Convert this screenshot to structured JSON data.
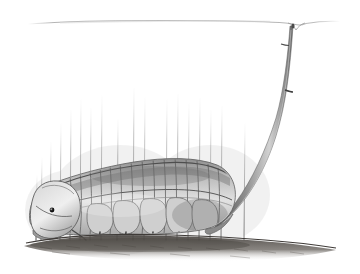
{
  "artwork": {
    "title": "Snorkeling aquatic larva with respiratory tail siphon",
    "medium": "graphite pencil drawing",
    "caption": "",
    "background_color": "#ffffff",
    "ink_color": "#4a4a4a",
    "shadow_color": "#6e6e6e",
    "ground_color": "#5a5550",
    "canvas": {
      "width": 360,
      "height": 274
    }
  },
  "scene": {
    "water_surface": {
      "name": "water-surface-line",
      "label": "water surface",
      "y": 22,
      "x_start": 28,
      "x_end": 340,
      "meniscus_x": 296,
      "meniscus_dip": 7,
      "color": "#b9b9b9"
    },
    "siphon": {
      "name": "respiratory-siphon",
      "label": "breathing tube (tail siphon)",
      "tip_x": 296,
      "tip_y": 24,
      "base_x": 228,
      "base_y": 228,
      "joint_y": 92,
      "color": "#6b6b6b"
    },
    "creature": {
      "name": "aquatic-larva",
      "label": "segmented larva",
      "head_x": 52,
      "head_y": 212,
      "eye_x": 52,
      "eye_y": 210,
      "body_length": 180,
      "dorsal_segments": 17,
      "ventral_lobes": 6,
      "leg_pairs": 5
    },
    "ground": {
      "name": "muddy-substrate",
      "label": "mud bottom",
      "y": 238,
      "x_start": 24,
      "x_end": 336,
      "color": "#585450"
    },
    "reeds": {
      "name": "reed-bed",
      "label": "submerged reeds",
      "count": 120,
      "x_start": 30,
      "x_end": 330,
      "base_y": 240,
      "max_height": 150,
      "color": "#8e8e8e"
    }
  }
}
